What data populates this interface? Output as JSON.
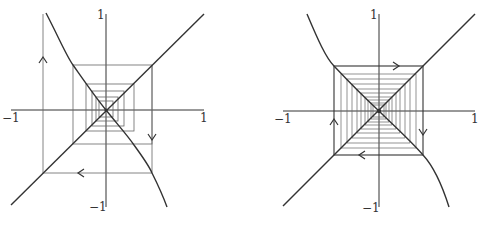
{
  "panels": [
    {
      "id": "left",
      "axis_labels": {
        "x_min": "−1",
        "x_max": "1",
        "y_max": "1",
        "y_min": "−1"
      },
      "description": "Cobweb diagram with outward spiral (unstable), arrows: up on left, down on right, left on bottom"
    },
    {
      "id": "right",
      "axis_labels": {
        "x_min": "−1",
        "x_max": "1",
        "y_max": "1",
        "y_min": "−1"
      },
      "description": "Cobweb diagram with square box converging to origin, arrows: right on top, down on right, left on bottom, up on left"
    }
  ],
  "colors": {
    "line": "#333333",
    "grid": "#777777"
  }
}
